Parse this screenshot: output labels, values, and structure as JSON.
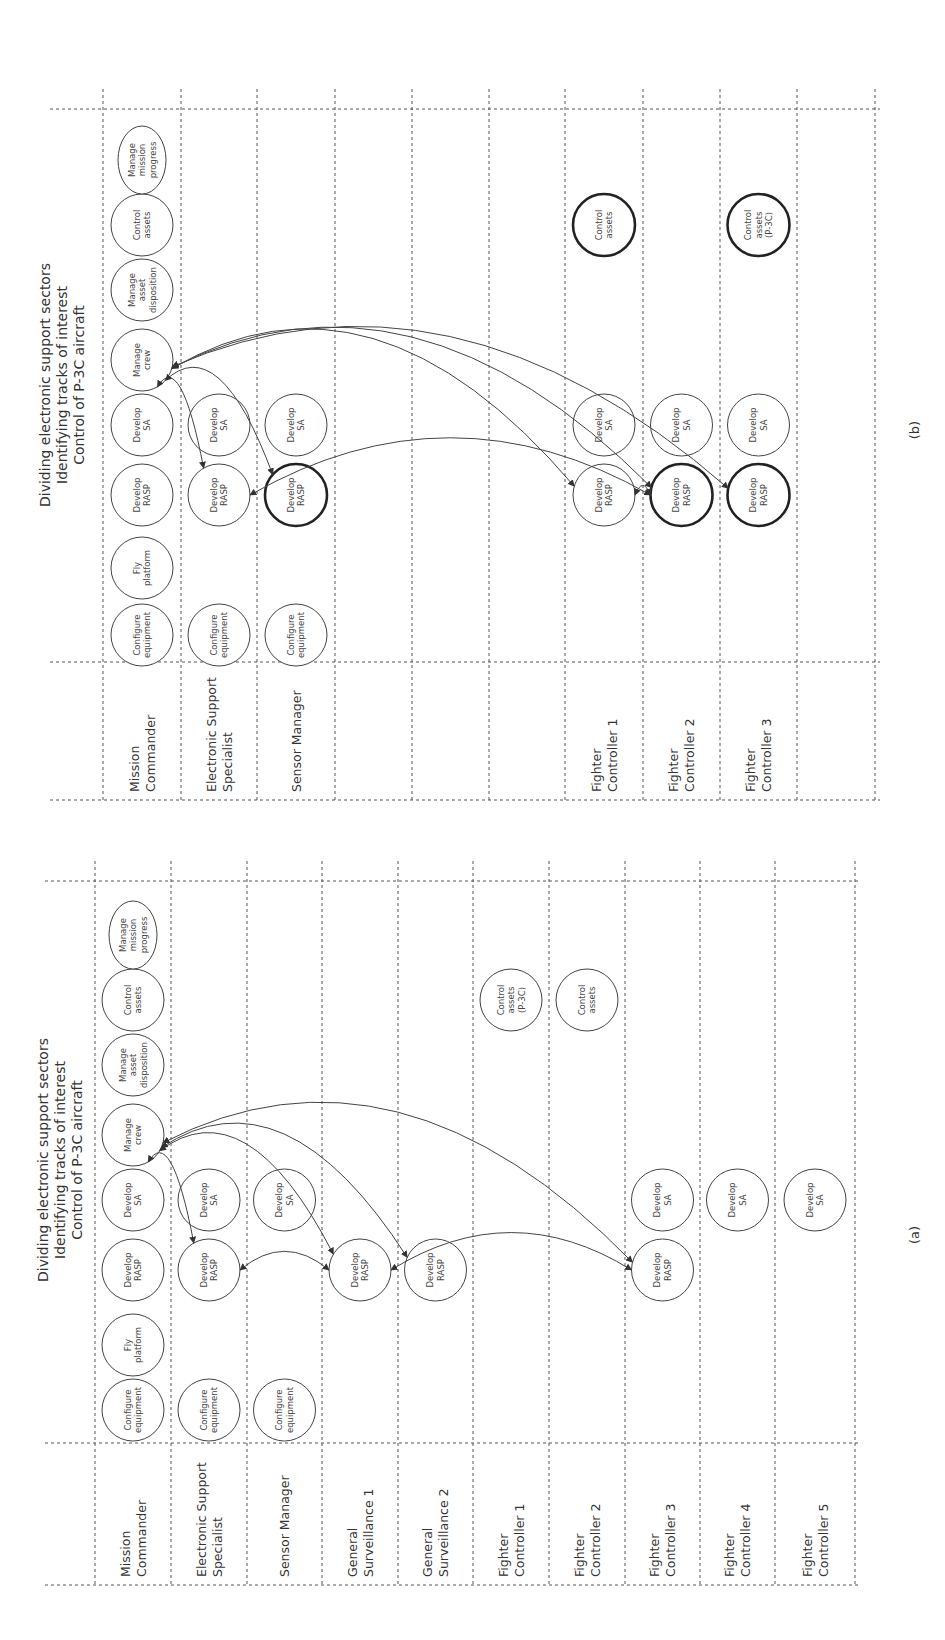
{
  "figure": {
    "orientation": "rotated-90-ccw",
    "panels": [
      {
        "id": "a",
        "label": "(a)",
        "title_lines": [
          "Dividing electronic support sectors",
          "Identifying tracks of interest",
          "Control of P-3C aircraft"
        ],
        "lanes": [
          {
            "id": "MC",
            "label_lines": [
              "Mission",
              "Commander"
            ]
          },
          {
            "id": "ESS",
            "label_lines": [
              "Electronic Support",
              "Specialist"
            ]
          },
          {
            "id": "SM",
            "label_lines": [
              "Sensor Manager"
            ]
          },
          {
            "id": "GS1",
            "label_lines": [
              "General",
              "Surveillance 1"
            ]
          },
          {
            "id": "GS2",
            "label_lines": [
              "General",
              "Surveillance 2"
            ]
          },
          {
            "id": "FC1",
            "label_lines": [
              "Fighter",
              "Controller 1"
            ]
          },
          {
            "id": "FC2",
            "label_lines": [
              "Fighter",
              "Controller 2"
            ]
          },
          {
            "id": "FC3",
            "label_lines": [
              "Fighter",
              "Controller 3"
            ]
          },
          {
            "id": "FC4",
            "label_lines": [
              "Fighter",
              "Controller 4"
            ]
          },
          {
            "id": "FC5",
            "label_lines": [
              "Fighter",
              "Controller 5"
            ]
          }
        ],
        "nodes": [
          {
            "id": "a-mc-cfg",
            "lane": "MC",
            "slot": "configure",
            "lines": [
              "Configure",
              "equipment"
            ],
            "bold": false
          },
          {
            "id": "a-mc-fly",
            "lane": "MC",
            "slot": "fly",
            "lines": [
              "Fly",
              "platform"
            ],
            "bold": false
          },
          {
            "id": "a-mc-rasp",
            "lane": "MC",
            "slot": "rasp",
            "lines": [
              "Develop",
              "RASP"
            ],
            "bold": false
          },
          {
            "id": "a-mc-sa",
            "lane": "MC",
            "slot": "sa",
            "lines": [
              "Develop",
              "SA"
            ],
            "bold": false
          },
          {
            "id": "a-mc-crew",
            "lane": "MC",
            "slot": "crew",
            "lines": [
              "Manage",
              "crew"
            ],
            "bold": false
          },
          {
            "id": "a-mc-disp",
            "lane": "MC",
            "slot": "disp",
            "lines": [
              "Manage",
              "asset",
              "disposition"
            ],
            "bold": false
          },
          {
            "id": "a-mc-ctrl",
            "lane": "MC",
            "slot": "ctrl",
            "lines": [
              "Control",
              "assets"
            ],
            "bold": false
          },
          {
            "id": "a-mc-prog",
            "lane": "MC",
            "slot": "prog",
            "lines": [
              "Manage",
              "mission",
              "progress"
            ],
            "bold": false,
            "ellipse": true
          },
          {
            "id": "a-ess-cfg",
            "lane": "ESS",
            "slot": "configure",
            "lines": [
              "Configure",
              "equipment"
            ],
            "bold": false
          },
          {
            "id": "a-ess-rasp",
            "lane": "ESS",
            "slot": "rasp",
            "lines": [
              "Develop",
              "RASP"
            ],
            "bold": false
          },
          {
            "id": "a-ess-sa",
            "lane": "ESS",
            "slot": "sa",
            "lines": [
              "Develop",
              "SA"
            ],
            "bold": false
          },
          {
            "id": "a-sm-cfg",
            "lane": "SM",
            "slot": "configure",
            "lines": [
              "Configure",
              "equipment"
            ],
            "bold": false
          },
          {
            "id": "a-sm-sa",
            "lane": "SM",
            "slot": "sa",
            "lines": [
              "Develop",
              "SA"
            ],
            "bold": false
          },
          {
            "id": "a-gs1-rasp",
            "lane": "GS1",
            "slot": "rasp",
            "lines": [
              "Develop",
              "RASP"
            ],
            "bold": false
          },
          {
            "id": "a-gs2-rasp",
            "lane": "GS2",
            "slot": "rasp",
            "lines": [
              "Develop",
              "RASP"
            ],
            "bold": false
          },
          {
            "id": "a-fc1-ctrl",
            "lane": "FC1",
            "slot": "ctrl",
            "lines": [
              "Control",
              "assets",
              "(P-3C)"
            ],
            "bold": false
          },
          {
            "id": "a-fc2-ctrl",
            "lane": "FC2",
            "slot": "ctrl",
            "lines": [
              "Control",
              "assets"
            ],
            "bold": false
          },
          {
            "id": "a-fc3-rasp",
            "lane": "FC3",
            "slot": "rasp",
            "lines": [
              "Develop",
              "RASP"
            ],
            "bold": false
          },
          {
            "id": "a-fc3-sa",
            "lane": "FC3",
            "slot": "sa",
            "lines": [
              "Develop",
              "SA"
            ],
            "bold": false
          },
          {
            "id": "a-fc4-sa",
            "lane": "FC4",
            "slot": "sa",
            "lines": [
              "Develop",
              "SA"
            ],
            "bold": false
          },
          {
            "id": "a-fc5-sa",
            "lane": "FC5",
            "slot": "sa",
            "lines": [
              "Develop",
              "SA"
            ],
            "bold": false
          }
        ],
        "edges": [
          {
            "from": "a-mc-crew",
            "to": "a-ess-rasp",
            "bidirectional": true
          },
          {
            "from": "a-mc-crew",
            "to": "a-gs1-rasp",
            "bidirectional": true
          },
          {
            "from": "a-mc-crew",
            "to": "a-gs2-rasp",
            "bidirectional": true
          },
          {
            "from": "a-mc-crew",
            "to": "a-fc3-rasp",
            "bidirectional": true
          },
          {
            "from": "a-ess-rasp",
            "to": "a-gs1-rasp",
            "bidirectional": true
          },
          {
            "from": "a-gs1-rasp",
            "to": "a-fc3-rasp",
            "bidirectional": true
          }
        ]
      },
      {
        "id": "b",
        "label": "(b)",
        "title_lines": [
          "Dividing electronic support sectors",
          "Identifying tracks of interest",
          "Control of P-3C aircraft"
        ],
        "lanes": [
          {
            "id": "MC",
            "label_lines": [
              "Mission",
              "Commander"
            ]
          },
          {
            "id": "ESS",
            "label_lines": [
              "Electronic Support",
              "Specialist"
            ]
          },
          {
            "id": "SM",
            "label_lines": [
              "Sensor Manager"
            ]
          },
          {
            "id": "E1",
            "label_lines": []
          },
          {
            "id": "E2",
            "label_lines": []
          },
          {
            "id": "E3",
            "label_lines": []
          },
          {
            "id": "FC1",
            "label_lines": [
              "Fighter",
              "Controller 1"
            ]
          },
          {
            "id": "FC2",
            "label_lines": [
              "Fighter",
              "Controller 2"
            ]
          },
          {
            "id": "FC3",
            "label_lines": [
              "Fighter",
              "Controller 3"
            ]
          },
          {
            "id": "E4",
            "label_lines": []
          }
        ],
        "nodes": [
          {
            "id": "b-mc-cfg",
            "lane": "MC",
            "slot": "configure",
            "lines": [
              "Configure",
              "equipment"
            ],
            "bold": false
          },
          {
            "id": "b-mc-fly",
            "lane": "MC",
            "slot": "fly",
            "lines": [
              "Fly",
              "platform"
            ],
            "bold": false
          },
          {
            "id": "b-mc-rasp",
            "lane": "MC",
            "slot": "rasp",
            "lines": [
              "Develop",
              "RASP"
            ],
            "bold": false
          },
          {
            "id": "b-mc-sa",
            "lane": "MC",
            "slot": "sa",
            "lines": [
              "Develop",
              "SA"
            ],
            "bold": false
          },
          {
            "id": "b-mc-crew",
            "lane": "MC",
            "slot": "crew",
            "lines": [
              "Manage",
              "crew"
            ],
            "bold": false
          },
          {
            "id": "b-mc-disp",
            "lane": "MC",
            "slot": "disp",
            "lines": [
              "Manage",
              "asset",
              "disposition"
            ],
            "bold": false
          },
          {
            "id": "b-mc-ctrl",
            "lane": "MC",
            "slot": "ctrl",
            "lines": [
              "Control",
              "assets"
            ],
            "bold": false
          },
          {
            "id": "b-mc-prog",
            "lane": "MC",
            "slot": "prog",
            "lines": [
              "Manage",
              "mission",
              "progress"
            ],
            "bold": false,
            "ellipse": true
          },
          {
            "id": "b-ess-cfg",
            "lane": "ESS",
            "slot": "configure",
            "lines": [
              "Configure",
              "equipment"
            ],
            "bold": false
          },
          {
            "id": "b-ess-rasp",
            "lane": "ESS",
            "slot": "rasp",
            "lines": [
              "Develop",
              "RASP"
            ],
            "bold": false
          },
          {
            "id": "b-ess-sa",
            "lane": "ESS",
            "slot": "sa",
            "lines": [
              "Develop",
              "SA"
            ],
            "bold": false
          },
          {
            "id": "b-sm-cfg",
            "lane": "SM",
            "slot": "configure",
            "lines": [
              "Configure",
              "equipment"
            ],
            "bold": false
          },
          {
            "id": "b-sm-rasp",
            "lane": "SM",
            "slot": "rasp",
            "lines": [
              "Develop",
              "RASP"
            ],
            "bold": true
          },
          {
            "id": "b-sm-sa",
            "lane": "SM",
            "slot": "sa",
            "lines": [
              "Develop",
              "SA"
            ],
            "bold": false
          },
          {
            "id": "b-fc1-rasp",
            "lane": "FC1",
            "slot": "rasp",
            "lines": [
              "Develop",
              "RASP"
            ],
            "bold": false
          },
          {
            "id": "b-fc1-sa",
            "lane": "FC1",
            "slot": "sa",
            "lines": [
              "Develop",
              "SA"
            ],
            "bold": false
          },
          {
            "id": "b-fc1-ctrl",
            "lane": "FC1",
            "slot": "ctrl",
            "lines": [
              "Control",
              "assets"
            ],
            "bold": true
          },
          {
            "id": "b-fc2-rasp",
            "lane": "FC2",
            "slot": "rasp",
            "lines": [
              "Develop",
              "RASP"
            ],
            "bold": true
          },
          {
            "id": "b-fc2-sa",
            "lane": "FC2",
            "slot": "sa",
            "lines": [
              "Develop",
              "SA"
            ],
            "bold": false
          },
          {
            "id": "b-fc3-rasp",
            "lane": "FC3",
            "slot": "rasp",
            "lines": [
              "Develop",
              "RASP"
            ],
            "bold": true
          },
          {
            "id": "b-fc3-sa",
            "lane": "FC3",
            "slot": "sa",
            "lines": [
              "Develop",
              "SA"
            ],
            "bold": false
          },
          {
            "id": "b-fc3-ctrl",
            "lane": "FC3",
            "slot": "ctrl",
            "lines": [
              "Control",
              "assets",
              "(P-3C)"
            ],
            "bold": true
          }
        ],
        "edges": [
          {
            "from": "b-mc-crew",
            "to": "b-ess-rasp",
            "bidirectional": true
          },
          {
            "from": "b-mc-crew",
            "to": "b-sm-rasp",
            "bidirectional": true
          },
          {
            "from": "b-mc-crew",
            "to": "b-fc1-rasp",
            "bidirectional": true
          },
          {
            "from": "b-mc-crew",
            "to": "b-fc2-rasp",
            "bidirectional": true
          },
          {
            "from": "b-mc-crew",
            "to": "b-fc3-rasp",
            "bidirectional": true
          },
          {
            "from": "b-fc1-rasp",
            "to": "b-fc2-rasp",
            "bidirectional": true
          },
          {
            "from": "b-ess-rasp",
            "to": "b-fc2-rasp",
            "bidirectional": true
          }
        ]
      }
    ]
  }
}
